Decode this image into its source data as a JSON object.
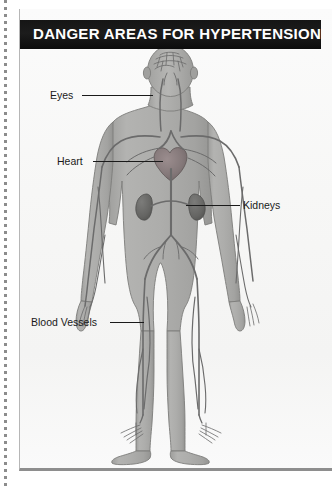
{
  "panel": {
    "title": "DANGER AREAS FOR HYPERTENSION",
    "title_bar_color": "#141414",
    "page_background": "#f7f7f6",
    "page_border_color": "#8e8e8e"
  },
  "diagram": {
    "type": "anatomical-illustration",
    "view": "anterior-full-body",
    "body_fill_color": "#a9a9a7",
    "vessel_color": "#6b6b6b",
    "organ_color": "#6e6e6e",
    "heart_color": "#8a8081",
    "skin_outline_color": "#7a7a78"
  },
  "callouts": [
    {
      "id": "eyes",
      "label": "Eyes",
      "target_organ": "eyes",
      "leader_direction": "right"
    },
    {
      "id": "heart",
      "label": "Heart",
      "target_organ": "heart",
      "leader_direction": "right"
    },
    {
      "id": "kidneys",
      "label": "Kidneys",
      "target_organ": "kidneys",
      "leader_direction": "left"
    },
    {
      "id": "blood_vessels",
      "label": "Blood Vessels",
      "target_organ": "blood-vessels-leg",
      "leader_direction": "right"
    }
  ],
  "margin": {
    "cut_line_style": "dotted",
    "cut_line_color": "#8c8c8c"
  }
}
